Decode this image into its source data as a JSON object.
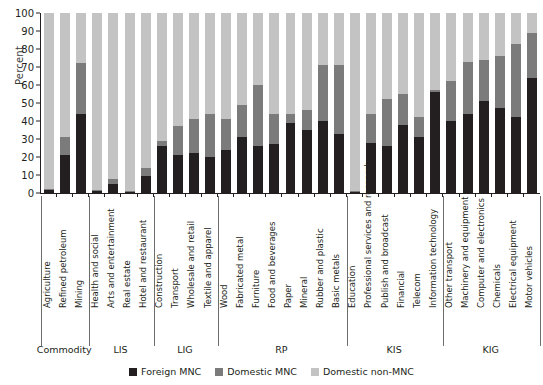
{
  "chart_data": {
    "type": "bar",
    "subtype": "stacked-bar-100-percent",
    "title": "",
    "xlabel": "",
    "ylabel": "Percent",
    "ylim": [
      0,
      100
    ],
    "yticks": [
      0,
      10,
      20,
      30,
      40,
      50,
      60,
      70,
      80,
      90,
      100
    ],
    "grid": false,
    "legend_position": "bottom-center",
    "legend": [
      "Foreign MNC",
      "Domestic MNC",
      "Domestic non-MNC"
    ],
    "colors": {
      "Foreign MNC": "#231f20",
      "Domestic MNC": "#7b7b7b",
      "Domestic non-MNC": "#c3c3c3"
    },
    "categories": [
      "Agriculture",
      "Refined petroleum",
      "Mining",
      "Health and social",
      "Arts and entertainment",
      "Real estate",
      "Hotel and restaurant",
      "Construction",
      "Transport",
      "Wholesale and retail",
      "Textile and apparel",
      "Wood",
      "Fabricated metal",
      "Furniture",
      "Food and beverages",
      "Paper",
      "Mineral",
      "Rubber and plastic",
      "Basic metals",
      "Education",
      "Professional services and research",
      "Publish and broadcast",
      "Financial",
      "Telecom",
      "Information technology",
      "Other transport",
      "Machinery and equipment",
      "Computer and electronics",
      "Chemicals",
      "Electrical equipment",
      "Motor vehicles"
    ],
    "groups": [
      {
        "label": "Commodity",
        "start": 0,
        "end": 3
      },
      {
        "label": "LIS",
        "start": 3,
        "end": 7
      },
      {
        "label": "LIG",
        "start": 7,
        "end": 11
      },
      {
        "label": "RP",
        "start": 11,
        "end": 19
      },
      {
        "label": "KIS",
        "start": 19,
        "end": 25
      },
      {
        "label": "KIG",
        "start": 25,
        "end": 31
      }
    ],
    "series": [
      {
        "name": "Foreign MNC",
        "values": [
          1.5,
          21,
          44,
          1,
          5,
          0.5,
          9.5,
          26,
          21,
          22,
          20,
          24,
          31,
          26,
          27,
          39,
          35,
          40,
          33,
          0.5,
          28,
          26,
          38,
          31,
          56,
          40,
          44,
          51,
          47,
          42,
          64
        ]
      },
      {
        "name": "Domestic MNC",
        "values": [
          0.5,
          10,
          28,
          0.5,
          3,
          0.5,
          4.5,
          3,
          16,
          19,
          24,
          17,
          18,
          34,
          17,
          5,
          11,
          31,
          38,
          0.5,
          16,
          26,
          17,
          11,
          1,
          22,
          29,
          23,
          29,
          41,
          25
        ]
      },
      {
        "name": "Domestic non-MNC",
        "values": [
          98,
          69,
          28,
          98.5,
          92,
          99,
          86,
          71,
          63,
          59,
          56,
          59,
          51,
          40,
          56,
          56,
          54,
          29,
          29,
          99,
          56,
          48,
          45,
          58,
          43,
          38,
          27,
          26,
          24,
          17,
          11
        ]
      }
    ]
  }
}
